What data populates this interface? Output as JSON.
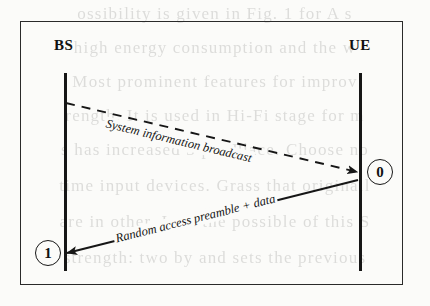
{
  "figure": {
    "type": "sequence-diagram",
    "background_color": "#fbfbf9",
    "line_color": "#161616",
    "actors": [
      {
        "id": "bs",
        "label": "BS",
        "side": "left"
      },
      {
        "id": "ue",
        "label": "UE",
        "side": "right"
      }
    ],
    "state_markers": [
      {
        "id": "ue-state",
        "value": "0",
        "near_actor": "UE"
      },
      {
        "id": "bs-state",
        "value": "1",
        "near_actor": "BS"
      }
    ],
    "messages": [
      {
        "id": "downlink",
        "label": "System information broadcast",
        "from": "BS",
        "to": "UE",
        "style": "dashed",
        "direction": "left-to-right"
      },
      {
        "id": "uplink",
        "label": "Random access preamble + data",
        "from": "UE",
        "to": "BS",
        "style": "solid",
        "direction": "right-to-left"
      }
    ]
  },
  "scan_bleed": {
    "visible": true,
    "note": "faint show-through text from the reverse side of the scanned page",
    "lines": [
      "ossibility is given in  Fig. 1 for A s",
      "high energy consumption and the w",
      "Most prominent features for improv",
      "rength. It is used in Hi-Fi stage for m",
      "s has increased 3 per  Place. Choose no",
      "time input devices. Grass that originall",
      "are in other. I am the possible of this S",
      "strength:  two by and sets the  previous"
    ]
  }
}
